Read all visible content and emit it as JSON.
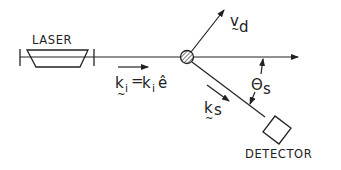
{
  "diagram": {
    "type": "laser-scattering-geometry",
    "labels": {
      "laser": "LASER",
      "detector": "DETECTOR",
      "velocity": "v",
      "velocity_sub": "d",
      "incident_k": "k",
      "incident_k_sub": "i",
      "incident_eq": "=",
      "incident_mag": "k",
      "incident_mag_sub": "i",
      "unit_vec": "ê",
      "scattered_k": "k",
      "scattered_k_sub": "s",
      "angle": "Θ",
      "angle_sub": "s"
    },
    "colors": {
      "line": "#222222",
      "background": "#ffffff"
    },
    "nodes": [
      {
        "id": "laser",
        "label": "LASER"
      },
      {
        "id": "particle",
        "label": ""
      },
      {
        "id": "detector",
        "label": "DETECTOR"
      }
    ],
    "edges": [
      {
        "from": "laser",
        "to": "particle",
        "label": "k_i = k_i ê"
      },
      {
        "from": "particle",
        "to": "detector",
        "label": "k_s"
      },
      {
        "from": "particle",
        "to": "velocity",
        "label": "v_d"
      }
    ],
    "angle": {
      "label": "Θ_s",
      "between": [
        "incident beam",
        "scattered beam"
      ]
    }
  }
}
